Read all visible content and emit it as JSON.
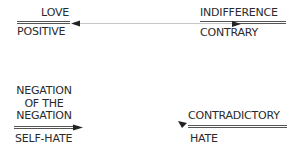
{
  "diagram": {
    "nodes": {
      "top_left": {
        "upper": "LOVE",
        "lower": "POSITIVE"
      },
      "top_right": {
        "upper": "INDIFFERENCE",
        "lower": "CONTRARY"
      },
      "bottom_left": {
        "upper_lines": [
          "NEGATION",
          "OF THE",
          "NEGATION"
        ],
        "lower": "SELF-HATE"
      },
      "bottom_right": {
        "upper": "CONTRADICTORY",
        "lower": "HATE"
      }
    },
    "edges": [
      {
        "from": "top_left",
        "to": "top_right",
        "style": "thin double-headed arrow"
      },
      {
        "from": "bottom_left",
        "direction": "arrowhead pointing right"
      },
      {
        "from": "bottom_right",
        "direction": "arrowhead pointing down-left"
      }
    ],
    "colors": {
      "text": "#2b2b2b",
      "lines": "#555555",
      "connector": "#c8c8c8",
      "background": "#ffffff"
    }
  }
}
